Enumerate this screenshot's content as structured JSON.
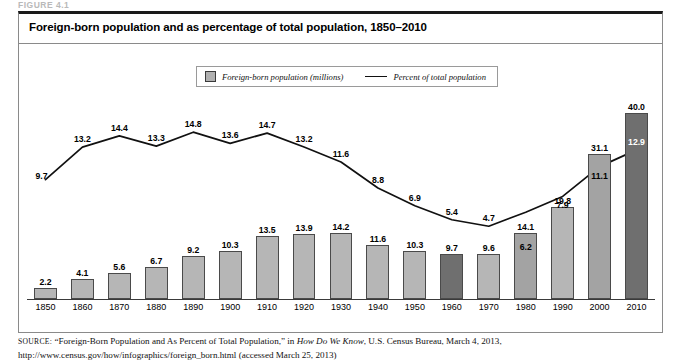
{
  "figure": {
    "label": "FIGURE 4.1",
    "title": "Foreign-born population and as percentage of total population, 1850–2010"
  },
  "legend": {
    "position": "top-center",
    "items": [
      {
        "icon": "gray-square-swatch",
        "label": "Foreign-born population (millions)"
      },
      {
        "icon": "black-line-swatch",
        "label": "Percent of total population"
      }
    ]
  },
  "source": {
    "prefix": "SOURCE:",
    "part1": " “Foreign-Born Population and As Percent of Total Population,” in ",
    "italic": "How Do We Know",
    "part2": ", U.S. Census Bureau, March 4, 2013, http://www.census.gov/how/infographics/foreign_born.html (accessed March 25, 2013)"
  },
  "chart_data": {
    "type": "bar",
    "title": "Foreign-born population and as percentage of total population, 1850–2010",
    "xlabel": "",
    "ylabel": "",
    "grid": false,
    "legend_position": "top-center",
    "categories": [
      "1850",
      "1860",
      "1870",
      "1880",
      "1890",
      "1900",
      "1910",
      "1920",
      "1930",
      "1940",
      "1950",
      "1960",
      "1970",
      "1980",
      "1990",
      "2000",
      "2010"
    ],
    "series": [
      {
        "name": "Foreign-born population (millions)",
        "type": "bar",
        "values": [
          2.2,
          4.1,
          5.6,
          6.7,
          9.2,
          10.3,
          13.5,
          13.9,
          14.2,
          11.6,
          10.3,
          9.7,
          9.6,
          14.1,
          19.8,
          31.1,
          40.0
        ],
        "ylim": [
          0,
          43
        ],
        "color": "#b6b6b6",
        "emphasis": {
          "1960": "#6f6f6f",
          "1980": "#a3a3a3",
          "2000": "#a3a3a3",
          "2010": "#6f6f6f"
        }
      },
      {
        "name": "Percent of total population",
        "type": "line",
        "values": [
          9.7,
          13.2,
          14.4,
          13.3,
          14.8,
          13.6,
          14.7,
          13.2,
          11.6,
          8.8,
          6.9,
          5.4,
          4.7,
          6.2,
          7.9,
          11.1,
          12.9
        ],
        "ylim": [
          0,
          16
        ],
        "color": "#111111"
      }
    ]
  }
}
